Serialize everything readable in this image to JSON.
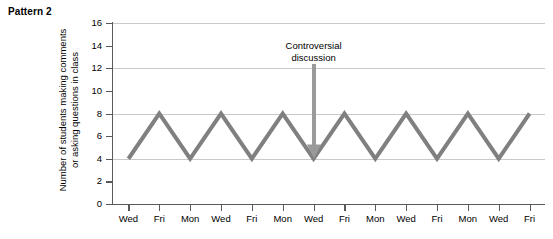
{
  "title": "Pattern 2",
  "chart_data": {
    "type": "line",
    "title": "Pattern 2",
    "xlabel": "",
    "ylabel": "Number of students making comments or asking questions in class",
    "ylabel_lines": [
      "Number of students making comments",
      "or asking questions in class"
    ],
    "categories": [
      "Wed",
      "Fri",
      "Mon",
      "Wed",
      "Fri",
      "Mon",
      "Wed",
      "Fri",
      "Mon",
      "Wed",
      "Fri",
      "Mon",
      "Wed",
      "Fri"
    ],
    "values": [
      4,
      8,
      4,
      8,
      4,
      8,
      4,
      8,
      4,
      8,
      4,
      8,
      4,
      8
    ],
    "ylim": [
      0,
      16
    ],
    "ytick_labels": [
      "0",
      "2",
      "4",
      "6",
      "8",
      "10",
      "12",
      "14",
      "16"
    ],
    "ytick_values": [
      0,
      2,
      4,
      6,
      8,
      10,
      12,
      14,
      16
    ],
    "gridlines_at": [
      4,
      8,
      12,
      16
    ],
    "grid": true,
    "legend": "none",
    "line_color": "#808080",
    "grid_color": "#c9c9c9",
    "axis_color": "#595959",
    "annotations": [
      {
        "text_lines": [
          "Controversial",
          "discussion"
        ],
        "text": "Controversial discussion",
        "points_to_category_index": 6,
        "points_to_value": 4,
        "arrow_color": "#9a9a9a"
      }
    ]
  }
}
